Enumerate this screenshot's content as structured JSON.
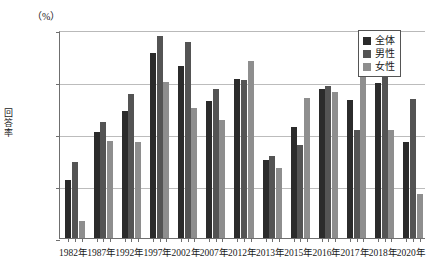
{
  "chart_data": {
    "type": "bar",
    "title": "",
    "xlabel": "",
    "ylabel": "回答率",
    "unit_label": "（%）",
    "ylim": [
      45.0,
      65.0
    ],
    "ytick_labels": [
      "65.0",
      "60.0",
      "55.0",
      "50.0",
      "45.0"
    ],
    "ytick_values": [
      65.0,
      60.0,
      55.0,
      50.0,
      45.0
    ],
    "grid": true,
    "legend_position": "top-right",
    "categories": [
      "1982年",
      "1987年",
      "1992年",
      "1997年",
      "2002年",
      "2007年",
      "2012年",
      "2013年",
      "2015年",
      "2016年",
      "2017年",
      "2018年",
      "2020年"
    ],
    "series": [
      {
        "name": "全体",
        "color": "#2b2b2b",
        "values": [
          50.6,
          55.2,
          57.2,
          62.8,
          61.5,
          58.2,
          60.3,
          52.5,
          55.7,
          59.3,
          58.3,
          59.9,
          54.2
        ]
      },
      {
        "name": "男性",
        "color": "#545454",
        "values": [
          52.3,
          56.2,
          58.8,
          64.4,
          63.8,
          59.3,
          60.2,
          52.9,
          53.9,
          59.6,
          55.4,
          61.6,
          58.4
        ]
      },
      {
        "name": "女性",
        "color": "#8e8e8e",
        "values": [
          46.6,
          54.3,
          54.2,
          60.0,
          57.5,
          56.3,
          62.0,
          51.7,
          58.5,
          59.0,
          62.7,
          55.4,
          49.2
        ]
      }
    ]
  }
}
